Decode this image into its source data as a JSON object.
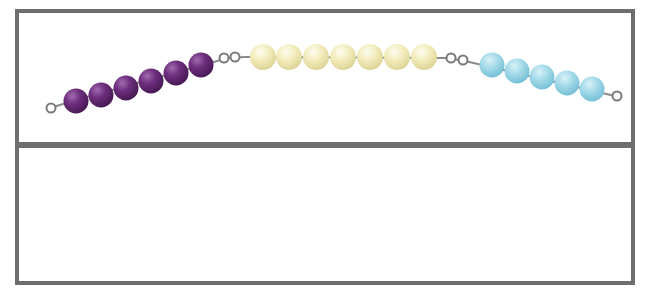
{
  "diagram": {
    "title": "",
    "top_panel": {
      "description": "bead string with three groups of beads",
      "groups": [
        {
          "name": "purple",
          "count": 6,
          "color": "#6b2d7a"
        },
        {
          "name": "yellow",
          "count": 7,
          "color": "#f1ecb8"
        },
        {
          "name": "blue",
          "count": 5,
          "color": "#9fd8e8"
        }
      ]
    },
    "bottom_panel": {
      "content": ""
    },
    "colors": {
      "border": "#6e6e6e",
      "ring": "#808080",
      "background": "#ffffff"
    }
  }
}
